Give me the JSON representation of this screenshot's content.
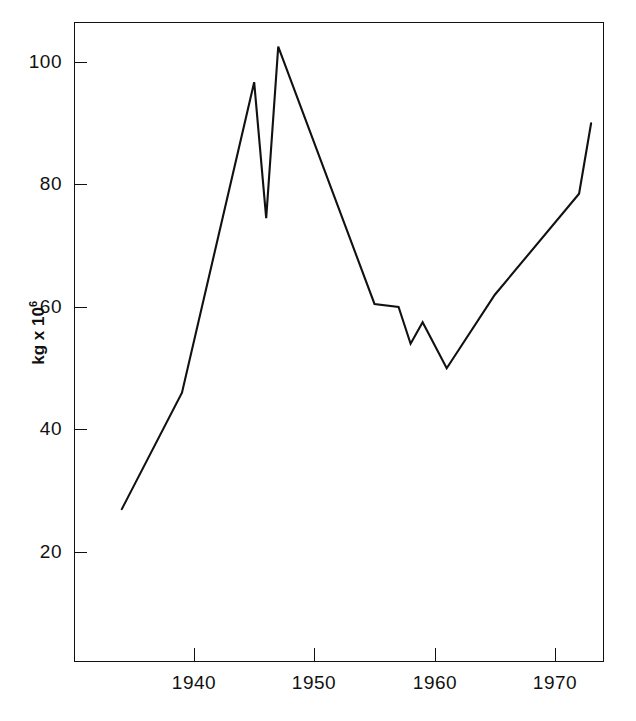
{
  "chart_data": {
    "type": "line",
    "title": "",
    "xlabel": "",
    "ylabel": "kg x 10",
    "ylabel_exponent": "6",
    "xlim": [
      1933.5,
      1974
    ],
    "ylim": [
      0,
      106
    ],
    "grid": false,
    "legend": null,
    "x_ticks": [
      1940,
      1950,
      1960,
      1970
    ],
    "x_tick_labels": [
      "1940",
      "1950",
      "1960",
      "1970"
    ],
    "y_ticks": [
      20,
      40,
      60,
      80,
      100
    ],
    "y_tick_labels": [
      "20",
      "40",
      "60",
      "80",
      "100"
    ],
    "series": [
      {
        "name": "kg x 10^6",
        "color": "#111111",
        "x": [
          1934,
          1939,
          1945,
          1946,
          1947,
          1955,
          1957,
          1958,
          1959,
          1961,
          1965,
          1972,
          1973
        ],
        "values": [
          27,
          46,
          96.7,
          74.5,
          102.5,
          60.5,
          60,
          54,
          57.5,
          50,
          62,
          78.5,
          90
        ]
      }
    ]
  },
  "axes": {
    "y_title_text": "kg x 10",
    "y_title_sup": "6"
  }
}
